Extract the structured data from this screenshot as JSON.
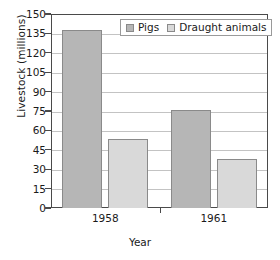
{
  "chart_data": {
    "type": "bar",
    "title": "",
    "xlabel": "Year",
    "ylabel": "Livestock (millions)",
    "categories": [
      "1958",
      "1961"
    ],
    "series": [
      {
        "name": "Pigs",
        "values": [
          138,
          76
        ],
        "color": "#b6b6b6"
      },
      {
        "name": "Draught animals",
        "values": [
          53,
          38
        ],
        "color": "#d9d9d9"
      }
    ],
    "ylim": [
      0,
      150
    ],
    "ytick_step": 15,
    "yticks": [
      0,
      15,
      30,
      45,
      60,
      75,
      90,
      105,
      120,
      135,
      150
    ],
    "ytick_labels": [
      "0",
      "15",
      "30",
      "45",
      "60",
      "75",
      "90",
      "105",
      "120",
      "135",
      "150"
    ],
    "grid": "horizontal",
    "legend_position": "top-right-inside",
    "bar_border_color": "#8a8a8a",
    "gridline_color": "#c3c3c3",
    "axis_color": "#4a4a4a",
    "plot_background": "#ffffff"
  }
}
